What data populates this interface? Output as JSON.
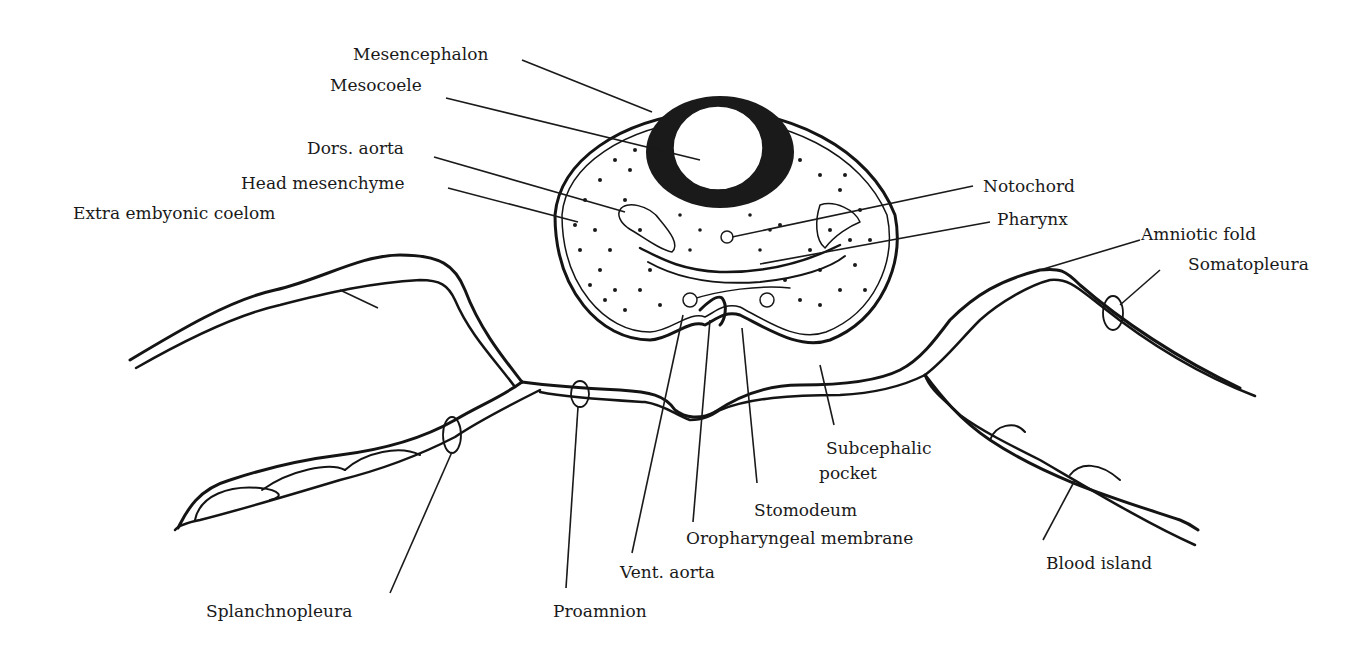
{
  "diagram": {
    "labels": {
      "mesencephalon": "Mesencephalon",
      "mesocoele": "Mesocoele",
      "dors_aorta": "Dors. aorta",
      "head_mesenchyme": "Head mesenchyme",
      "extra_embryonic_coelom": "Extra embyonic coelom",
      "notochord": "Notochord",
      "pharynx": "Pharynx",
      "amniotic_fold": "Amniotic fold",
      "somatopleura": "Somatopleura",
      "subcephalic_pocket_line1": "Subcephalic",
      "subcephalic_pocket_line2": "pocket",
      "stomodeum": "Stomodeum",
      "oropharyngeal_membrane": "Oropharyngeal membrane",
      "vent_aorta": "Vent. aorta",
      "blood_island": "Blood island",
      "splanchnopleura": "Splanchnopleura",
      "proamnion": "Proamnion"
    },
    "colors": {
      "ink": "#141414",
      "background": "#ffffff"
    }
  }
}
